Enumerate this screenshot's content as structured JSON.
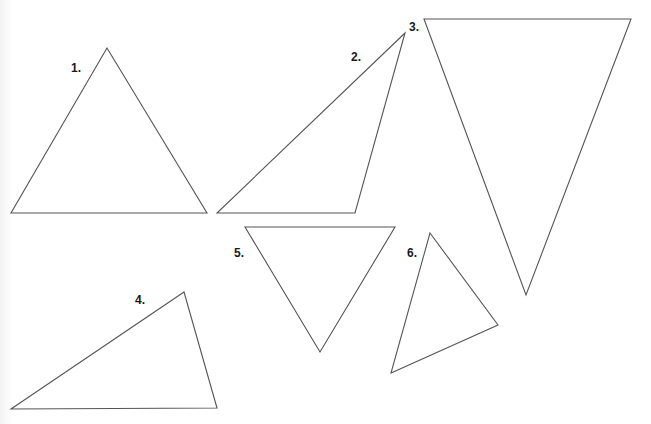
{
  "figure": {
    "width": 651,
    "height": 424,
    "stroke_color": "#555555",
    "background": "#ffffff"
  },
  "triangles": [
    {
      "label": "1.",
      "label_pos": [
        71,
        62
      ],
      "points": "107,48 11,213 207,213"
    },
    {
      "label": "2.",
      "label_pos": [
        351,
        51
      ],
      "points": "405,33 217,213 355,213"
    },
    {
      "label": "3.",
      "label_pos": [
        409,
        21
      ],
      "points": "424,19 631,19 526,295"
    },
    {
      "label": "4.",
      "label_pos": [
        135,
        294
      ],
      "points": "184,292 11,409 217,408"
    },
    {
      "label": "5.",
      "label_pos": [
        234,
        247
      ],
      "points": "245,227 395,227 320,352"
    },
    {
      "label": "6.",
      "label_pos": [
        407,
        247
      ],
      "points": "430,233 498,325 391,373"
    }
  ]
}
